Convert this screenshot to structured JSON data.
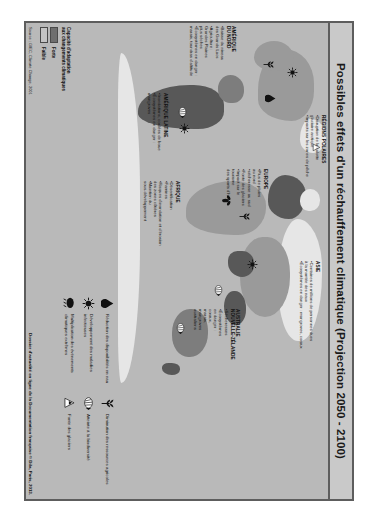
{
  "poster": {
    "title": "Possibles effets d'un réchauffement climatique (Projection 2050 - 2100)",
    "source": "Source : GIEC, Climate Change, 2001",
    "doc_credit": "Dossier d'actualité en ligne de la Documentation française © Dila, Paris, 2013."
  },
  "regions": [
    {
      "id": "regions-polaires",
      "heading": "RÉGIONS POLAIRES",
      "bullets": [
        "Disruption de la calotte glaciaire arctique",
        "Impacts sur les zones de pêche"
      ]
    },
    {
      "id": "amerique-du-nord",
      "heading": "AMÉRIQUE\nDU NORD",
      "bullets": [
        "Baisse du niveau\ndes Grands Lacs",
        "Agriculture :\nGrandes Plaines\nplus sèches",
        "Écosystèmes en danger :\nmarais, toundras d'altitude"
      ]
    },
    {
      "id": "amerique-latine",
      "heading": "AMÉRIQUE LATINE",
      "bullets": [
        "Inondations, coulées de boue",
        "Écosystèmes en danger :\nmangroves"
      ]
    },
    {
      "id": "europe",
      "heading": "EUROPE",
      "bullets": [
        "Plus de pluies\nau nord",
        "sécheresse au sud",
        "Fonte des glaciers",
        "Impact sur le\ntourisme\ndes sports d'hiver"
      ]
    },
    {
      "id": "afrique",
      "heading": "AFRIQUE",
      "bullets": [
        "Désertification",
        "Famines",
        "Risques d'inondation et d'érosion\ndes zones côtières",
        "Maintien du\nsous-développement"
      ]
    },
    {
      "id": "asie",
      "heading": "ASIE",
      "bullets": [
        "Centaines de millions de personnes dues\nà la montée des eaux",
        "Écosystèmes en danger : mangroves, coraux"
      ]
    },
    {
      "id": "australie-nouvelle-zelande",
      "heading": "AUSTRALIE\nNOUVELLE-ZÉLANDE",
      "bullets": [
        "Sécheresses",
        "Écosystèmes\nen danger :\ncoraux,\nmarais,\nmangroves\naustraliens"
      ]
    }
  ],
  "legend": {
    "column_left": [
      {
        "icon": "water-drop-icon",
        "label": "Réduction des disponibilités en eau"
      },
      {
        "icon": "mosquito-icon",
        "label": "Développement des maladies infectieuses"
      },
      {
        "icon": "storm-cloud-icon",
        "label": "Multiplication des événements climatiques extrêmes"
      }
    ],
    "column_right": [
      {
        "icon": "wheat-icon",
        "label": "Diminution des ressources agricoles"
      },
      {
        "icon": "coral-fish-icon",
        "label": "Atteinte à la biodiversité"
      },
      {
        "icon": "glacier-icon",
        "label": "Fonte des glaciers"
      }
    ],
    "adaptation": {
      "heading": "Capacité d'adaptation\naux changements climatiques",
      "levels": [
        {
          "label": "Forte",
          "color": "#6e6e6e"
        },
        {
          "label": "Faible",
          "color": "#c4c4c4"
        }
      ]
    }
  }
}
